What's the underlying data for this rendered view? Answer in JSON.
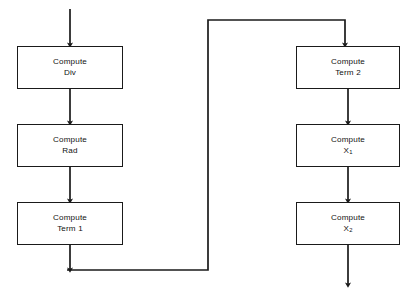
{
  "diagram": {
    "stroke_color": "#1a1a1a",
    "background_color": "#ffffff",
    "nodes": [
      {
        "id": "compute-div",
        "line1": "Compute",
        "line2": "Div",
        "sub": "",
        "x": 17,
        "y": 46,
        "w": 106,
        "h": 43
      },
      {
        "id": "compute-rad",
        "line1": "Compute",
        "line2": "Rad",
        "sub": "",
        "x": 17,
        "y": 124,
        "w": 106,
        "h": 43
      },
      {
        "id": "compute-term-1",
        "line1": "Compute",
        "line2": "Term 1",
        "sub": "",
        "x": 17,
        "y": 202,
        "w": 106,
        "h": 43
      },
      {
        "id": "compute-term-2",
        "line1": "Compute",
        "line2": "Term 2",
        "sub": "",
        "x": 296,
        "y": 46,
        "w": 104,
        "h": 43
      },
      {
        "id": "compute-x1",
        "line1": "Compute",
        "line2": "X",
        "sub": "1",
        "x": 296,
        "y": 124,
        "w": 104,
        "h": 43
      },
      {
        "id": "compute-x2",
        "line1": "Compute",
        "line2": "X",
        "sub": "2",
        "x": 296,
        "y": 202,
        "w": 104,
        "h": 43
      }
    ],
    "connectors": [
      {
        "id": "entry-arrow",
        "label": "entry into Compute Div"
      },
      {
        "id": "div-to-rad",
        "label": "Compute Div to Compute Rad"
      },
      {
        "id": "rad-to-term1",
        "label": "Compute Rad to Compute Term 1"
      },
      {
        "id": "term1-to-term2",
        "label": "Compute Term 1 routed to Compute Term 2"
      },
      {
        "id": "term2-to-x1",
        "label": "Compute Term 2 to Compute X1"
      },
      {
        "id": "x1-to-x2",
        "label": "Compute X1 to Compute X2"
      },
      {
        "id": "exit-arrow",
        "label": "exit from Compute X2"
      }
    ]
  }
}
